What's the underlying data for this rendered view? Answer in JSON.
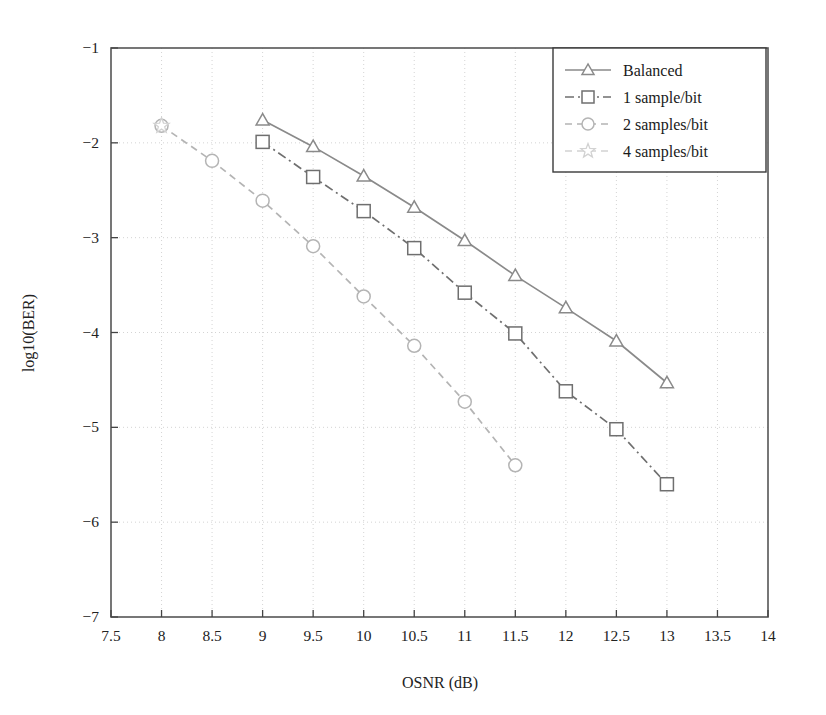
{
  "chart_data": {
    "type": "line",
    "title": "",
    "xlabel": "OSNR (dB)",
    "ylabel": "log10(BER)",
    "xlim": [
      7.5,
      14
    ],
    "ylim": [
      -7,
      -1
    ],
    "xticks": [
      7.5,
      8,
      8.5,
      9,
      9.5,
      10,
      10.5,
      11,
      11.5,
      12,
      12.5,
      13,
      13.5,
      14
    ],
    "xtick_labels": [
      "7.5",
      "8",
      "8.5",
      "9",
      "9.5",
      "10",
      "10.5",
      "11",
      "11.5",
      "12",
      "12.5",
      "13",
      "13.5",
      "14"
    ],
    "yticks": [
      -1,
      -2,
      -3,
      -4,
      -5,
      -6,
      -7
    ],
    "ytick_labels": [
      "−1",
      "−2",
      "−3",
      "−4",
      "−5",
      "−6",
      "−7"
    ],
    "grid": true,
    "legend_position": "top-right",
    "series": [
      {
        "name": "Balanced",
        "marker": "triangle",
        "linestyle": "solid",
        "color": "#8a8a8a",
        "x": [
          9,
          9.5,
          10,
          10.5,
          11,
          11.5,
          12,
          12.5,
          13
        ],
        "y": [
          -1.76,
          -2.04,
          -2.35,
          -2.68,
          -3.03,
          -3.4,
          -3.74,
          -4.09,
          -4.53
        ]
      },
      {
        "name": "1 sample/bit",
        "marker": "square",
        "linestyle": "dashdot",
        "color": "#6f6f6f",
        "x": [
          9,
          9.5,
          10,
          10.5,
          11,
          11.5,
          12,
          12.5,
          13
        ],
        "y": [
          -1.99,
          -2.36,
          -2.72,
          -3.11,
          -3.58,
          -4.01,
          -4.62,
          -5.02,
          -5.6
        ]
      },
      {
        "name": "2 samples/bit",
        "marker": "circle",
        "linestyle": "dashed",
        "color": "#b4b4b4",
        "x": [
          8,
          8.5,
          9,
          9.5,
          10,
          10.5,
          11,
          11.5
        ],
        "y": [
          -1.82,
          -2.19,
          -2.61,
          -3.09,
          -3.62,
          -4.14,
          -4.73,
          -5.4
        ]
      },
      {
        "name": "4 samples/bit",
        "marker": "star",
        "linestyle": "dashed",
        "color": "#d2d2d2",
        "x": [
          8
        ],
        "y": [
          -1.82
        ]
      }
    ]
  },
  "legend": {
    "items": [
      {
        "label": "Balanced"
      },
      {
        "label": "1 sample/bit"
      },
      {
        "label": "2 samples/bit"
      },
      {
        "label": "4 samples/bit"
      }
    ]
  }
}
